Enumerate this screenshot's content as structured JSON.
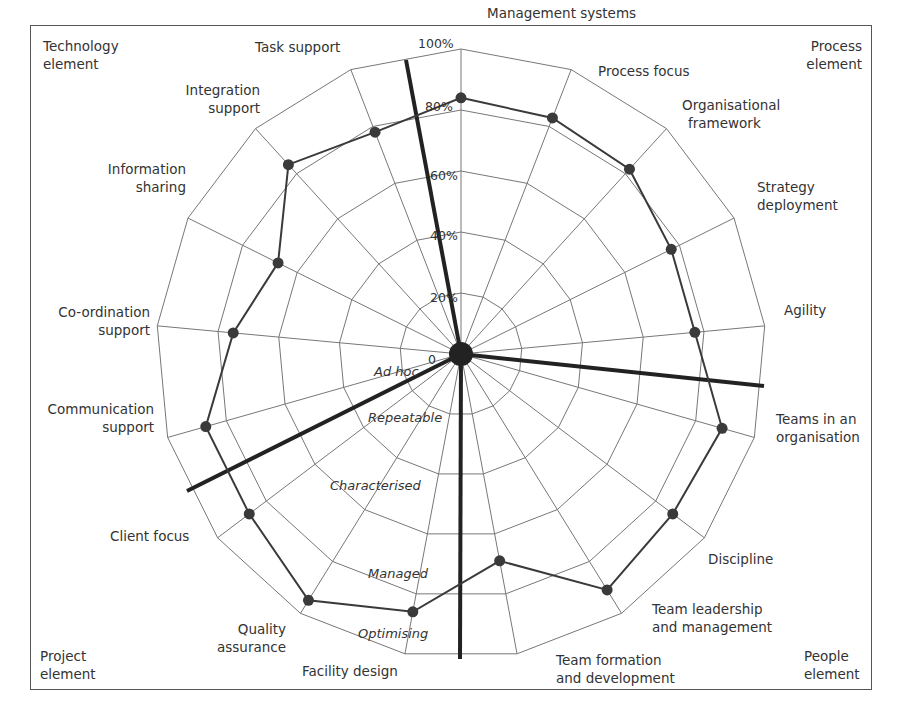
{
  "chart_data": {
    "type": "radar",
    "title": "",
    "scale": {
      "min": 0,
      "max": 100,
      "unit": "%"
    },
    "tick_labels": [
      "0",
      "20%",
      "40%",
      "60%",
      "80%",
      "100%"
    ],
    "rings": [
      20,
      40,
      60,
      80,
      100
    ],
    "maturity_levels": [
      "Ad hoc",
      "Repeatable",
      "Characterised",
      "Managed",
      "Optimising"
    ],
    "categories": [
      "Management systems",
      "Process focus",
      "Organisational framework",
      "Strategy deployment",
      "Agility",
      "Teams in an organisation",
      "Discipline",
      "Team leadership and management",
      "Team formation and development",
      "Facility design",
      "Quality assurance",
      "Client focus",
      "Communication support",
      "Co-ordination support",
      "Information sharing",
      "Integration support",
      "Task support"
    ],
    "series": [
      {
        "name": "Assessment",
        "values": [
          84,
          83,
          82,
          77,
          77,
          89,
          87,
          91,
          69,
          86,
          95,
          87,
          87,
          75,
          67,
          84,
          78
        ]
      }
    ],
    "groups": [
      {
        "name": "Process element",
        "position": "top-right"
      },
      {
        "name": "People element",
        "position": "bottom-right"
      },
      {
        "name": "Project element",
        "position": "bottom-left"
      },
      {
        "name": "Technology element",
        "position": "top-left"
      }
    ],
    "legend": "none",
    "grid": true
  },
  "corners": {
    "top_left": [
      "Technology",
      "element"
    ],
    "top_right": [
      "Process",
      "element"
    ],
    "bottom_left": [
      "Project",
      "element"
    ],
    "bottom_right": [
      "People",
      "element"
    ]
  },
  "axis_labels": [
    {
      "lines": [
        "Management systems"
      ]
    },
    {
      "lines": [
        "Process focus"
      ]
    },
    {
      "lines": [
        "Organisational",
        "framework"
      ]
    },
    {
      "lines": [
        "Strategy",
        "deployment"
      ]
    },
    {
      "lines": [
        "Agility"
      ]
    },
    {
      "lines": [
        "Teams in an",
        "organisation"
      ]
    },
    {
      "lines": [
        "Discipline"
      ]
    },
    {
      "lines": [
        "Team leadership",
        "and management"
      ]
    },
    {
      "lines": [
        "Team formation",
        "and development"
      ]
    },
    {
      "lines": [
        "Facility design"
      ]
    },
    {
      "lines": [
        "Quality",
        "assurance"
      ]
    },
    {
      "lines": [
        "Client focus"
      ]
    },
    {
      "lines": [
        "Communication",
        "support"
      ]
    },
    {
      "lines": [
        "Co-ordination",
        "support"
      ]
    },
    {
      "lines": [
        "Information",
        "sharing"
      ]
    },
    {
      "lines": [
        "Integration",
        "support"
      ]
    },
    {
      "lines": [
        "Task support"
      ]
    }
  ]
}
